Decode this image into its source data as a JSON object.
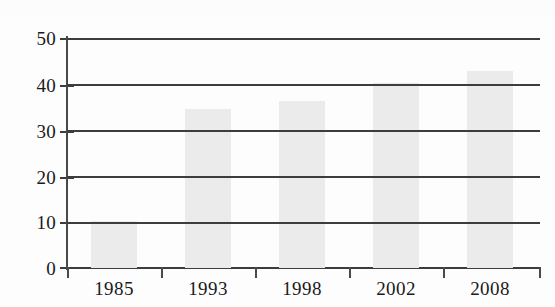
{
  "chart_data": {
    "type": "bar",
    "title": "",
    "subtitle": "",
    "xlabel": "",
    "ylabel": "",
    "categories": [
      "1985",
      "1993",
      "1998",
      "2002",
      "2008"
    ],
    "values": [
      10.3,
      34.5,
      36.3,
      40.2,
      42.8
    ],
    "series": [
      {
        "name": "",
        "values": [
          10.3,
          34.5,
          36.3,
          40.2,
          42.8
        ]
      }
    ],
    "ylim": [
      0,
      50
    ],
    "y_ticks": [
      0,
      10,
      20,
      30,
      40,
      50
    ],
    "y_tick_labels": [
      "0",
      "10",
      "20",
      "30",
      "40",
      "50"
    ],
    "x_tick_labels": [
      "1985",
      "1993",
      "1998",
      "2002",
      "2008"
    ],
    "grid": true,
    "grid_axis": "y",
    "legend": false,
    "legend_position": "none",
    "bar_color": "#ebebeb",
    "axis_color": "#3d3d3d",
    "gridline_color": "#3d3d3d",
    "background_color": "#fdfdfd",
    "annotations": []
  },
  "axes": {
    "y_labels": [
      {
        "text": "50",
        "value": 50
      },
      {
        "text": "40",
        "value": 40
      },
      {
        "text": "30",
        "value": 30
      },
      {
        "text": "20",
        "value": 20
      },
      {
        "text": "10",
        "value": 10
      },
      {
        "text": "0",
        "value": 0
      }
    ],
    "x_labels": [
      {
        "text": "1985"
      },
      {
        "text": "1993"
      },
      {
        "text": "1998"
      },
      {
        "text": "2002"
      },
      {
        "text": "2008"
      }
    ]
  },
  "bars": [
    {
      "category": "1985",
      "value": 10.3
    },
    {
      "category": "1993",
      "value": 34.5
    },
    {
      "category": "1998",
      "value": 36.3
    },
    {
      "category": "2002",
      "value": 40.2
    },
    {
      "category": "2008",
      "value": 42.8
    }
  ]
}
